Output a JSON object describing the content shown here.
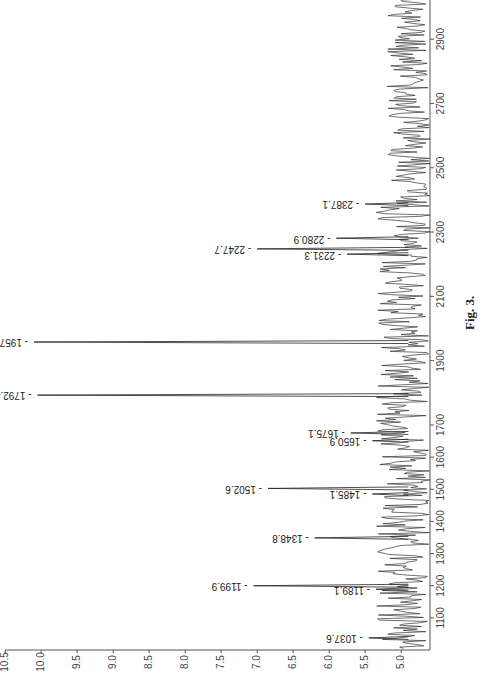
{
  "chart_data": {
    "type": "line",
    "title": "",
    "caption": "Fig. 3.",
    "xlabel": "Mass (m/z)",
    "ylabel": "",
    "orientation": "rotated-90-clockwise",
    "xlim": [
      1000,
      3500
    ],
    "ylim": [
      4.6,
      10.5
    ],
    "x_ticks": [
      1100,
      1200,
      1300,
      1400,
      1500,
      1600,
      1700,
      1900,
      2100,
      2300,
      2500,
      2700,
      2900,
      3100,
      3300,
      3500
    ],
    "y_ticks": [
      5.0,
      5.5,
      6.0,
      6.5,
      7.0,
      7.5,
      8.0,
      8.5,
      9.0,
      9.5,
      10.0,
      10.5
    ],
    "grid": false,
    "legend": null,
    "peaks": [
      {
        "mz": 1037.6,
        "label": "1037.6",
        "intensity": 5.45
      },
      {
        "mz": 1189.1,
        "label": "1189.1",
        "intensity": 5.35
      },
      {
        "mz": 1199.9,
        "label": "1199.9",
        "intensity": 7.05
      },
      {
        "mz": 1348.8,
        "label": "1348.8",
        "intensity": 6.2
      },
      {
        "mz": 1485.1,
        "label": "1485.1",
        "intensity": 5.4
      },
      {
        "mz": 1502.6,
        "label": "1502.6",
        "intensity": 6.85
      },
      {
        "mz": 1650.9,
        "label": "1650.9",
        "intensity": 5.4
      },
      {
        "mz": 1675.1,
        "label": "1675.1",
        "intensity": 5.7
      },
      {
        "mz": 1792.8,
        "label": "1792.8",
        "intensity": 10.05
      },
      {
        "mz": 1957.9,
        "label": "1957.9",
        "intensity": 10.1
      },
      {
        "mz": 2231.3,
        "label": "2231.3",
        "intensity": 5.75
      },
      {
        "mz": 2247.7,
        "label": "2247.7",
        "intensity": 7.0
      },
      {
        "mz": 2280.9,
        "label": "2280.9",
        "intensity": 5.9
      },
      {
        "mz": 2387.1,
        "label": "2387.1",
        "intensity": 5.5
      },
      {
        "mz": 3217.5,
        "label": "3217.5",
        "intensity": 5.15
      }
    ],
    "baseline_range": [
      4.6,
      5.35
    ]
  }
}
